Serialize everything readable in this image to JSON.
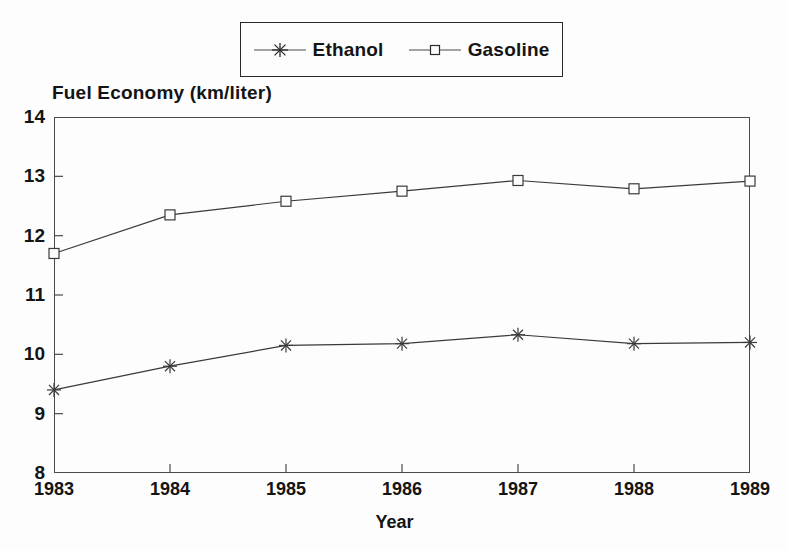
{
  "chart_data": {
    "type": "line",
    "title": "",
    "xlabel": "Year",
    "ylabel": "Fuel Economy (km/liter)",
    "categories": [
      "1983",
      "1984",
      "1985",
      "1986",
      "1987",
      "1988",
      "1989"
    ],
    "x": [
      1983,
      1984,
      1985,
      1986,
      1987,
      1988,
      1989
    ],
    "xlim": [
      1983,
      1989
    ],
    "ylim": [
      8,
      14
    ],
    "y_ticks": [
      8,
      9,
      10,
      11,
      12,
      13,
      14
    ],
    "x_ticks": [
      "1983",
      "1984",
      "1985",
      "1986",
      "1987",
      "1988",
      "1989"
    ],
    "grid": false,
    "legend_position": "top-center",
    "series": [
      {
        "name": "Ethanol",
        "marker": "star",
        "color": "#3a3a3a",
        "values": [
          9.4,
          9.8,
          10.15,
          10.18,
          10.33,
          10.18,
          10.2
        ]
      },
      {
        "name": "Gasoline",
        "marker": "square",
        "color": "#3a3a3a",
        "values": [
          11.7,
          12.35,
          12.58,
          12.75,
          12.93,
          12.79,
          12.92
        ]
      }
    ]
  },
  "legend": {
    "entries": [
      {
        "label": "Ethanol",
        "marker": "star-icon"
      },
      {
        "label": "Gasoline",
        "marker": "square-icon"
      }
    ]
  },
  "axes": {
    "y_title": "Fuel Economy (km/liter)",
    "x_title": "Year",
    "y_labels": [
      "14",
      "13",
      "12",
      "11",
      "10",
      "9",
      "8"
    ],
    "x_labels": [
      "1983",
      "1984",
      "1985",
      "1986",
      "1987",
      "1988",
      "1989"
    ]
  },
  "colors": {
    "ink": "#141414",
    "line": "#4a4a4a",
    "background": "#fdfdfd"
  }
}
